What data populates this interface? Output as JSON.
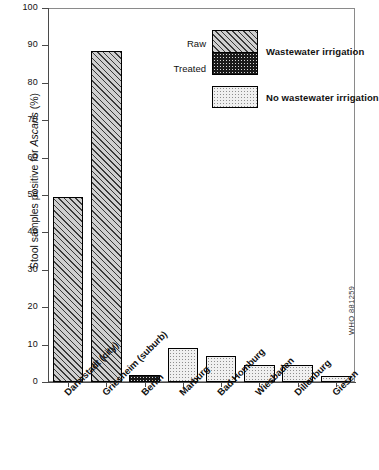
{
  "chart_data": {
    "type": "bar",
    "title": "",
    "xlabel": "",
    "ylabel": "Stool samples positive for Ascaris (%)",
    "ylabel_parts": {
      "pre": "Stool samples positive for ",
      "italic": "Ascaris",
      "post": " (%)"
    },
    "ylim": [
      0,
      100
    ],
    "yticks": [
      0,
      10,
      20,
      30,
      40,
      50,
      60,
      70,
      80,
      90,
      100
    ],
    "grid": false,
    "categories": [
      "Darmstadt (city)",
      "Griesheim (suburb)",
      "Berlin",
      "Marburg",
      "Bad Homburg",
      "Wiesbaden",
      "Dillenburg",
      "Giesen"
    ],
    "values": [
      49.5,
      88.5,
      2.0,
      9.0,
      7.0,
      4.5,
      4.5,
      1.5
    ],
    "bar_fill_types": [
      "raw",
      "raw",
      "treated",
      "none",
      "none",
      "none",
      "none",
      "none"
    ],
    "series": [
      {
        "name": "Wastewater irrigation — Raw",
        "fill": "raw",
        "points": [
          {
            "category": "Darmstadt (city)",
            "value": 49.5
          },
          {
            "category": "Griesheim (suburb)",
            "value": 88.5
          }
        ]
      },
      {
        "name": "Wastewater irrigation — Treated",
        "fill": "treated",
        "points": [
          {
            "category": "Berlin",
            "value": 2.0
          }
        ]
      },
      {
        "name": "No wastewater irrigation",
        "fill": "none",
        "points": [
          {
            "category": "Marburg",
            "value": 9.0
          },
          {
            "category": "Bad Homburg",
            "value": 7.0
          },
          {
            "category": "Wiesbaden",
            "value": 4.5
          },
          {
            "category": "Dillenburg",
            "value": 4.5
          },
          {
            "category": "Giesen",
            "value": 1.5
          }
        ]
      }
    ],
    "legend": {
      "position": "upper-right-inside",
      "entries": [
        {
          "sub_label": "Raw",
          "fill": "raw"
        },
        {
          "sub_label": "Treated",
          "fill": "treated"
        }
      ],
      "group_label_1": "Wastewater irrigation",
      "group_label_2": "No wastewater irrigation"
    },
    "annotation": "WHO 881259",
    "colors": {
      "raw_fill": "#cfcfcf",
      "raw_hatch": "#3a3a3a",
      "treated_fill": "#1a1a1a",
      "treated_dot": "#d8d8d8",
      "none_fill": "#f0f0f0",
      "none_dot": "#8e8e8e",
      "outline": "#000000",
      "axis": "#4a4a4a",
      "text": "#111111"
    }
  }
}
